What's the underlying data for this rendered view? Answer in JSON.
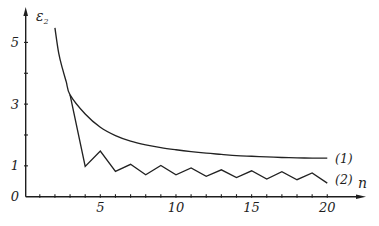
{
  "chart_data": {
    "type": "line",
    "title": "",
    "xlabel": "n",
    "ylabel": "ε",
    "ylabel_subscript": "2",
    "xlim": [
      0,
      22.5
    ],
    "ylim": [
      0,
      6.1
    ],
    "grid": false,
    "legend": "inline labels at right end of each curve",
    "x_ticks": [
      1,
      2,
      3,
      4,
      5,
      6,
      7,
      8,
      9,
      10,
      11,
      12,
      13,
      14,
      15,
      16,
      17,
      18,
      19,
      20
    ],
    "x_tick_labels": [
      {
        "value": 5,
        "label": "5"
      },
      {
        "value": 10,
        "label": "10"
      },
      {
        "value": 15,
        "label": "15"
      },
      {
        "value": 20,
        "label": "20"
      }
    ],
    "y_ticks": [
      1,
      2,
      3,
      4,
      5
    ],
    "y_tick_labels": [
      {
        "value": 0,
        "label": "0"
      },
      {
        "value": 1,
        "label": "1"
      },
      {
        "value": 3,
        "label": "3"
      },
      {
        "value": 5,
        "label": "5"
      }
    ],
    "series": [
      {
        "name": "(1)",
        "smooth": true,
        "x": [
          2,
          2.25,
          2.5,
          2.75,
          3,
          4,
          5,
          6,
          7,
          8,
          9,
          10,
          11,
          12,
          13,
          14,
          15,
          16,
          17,
          18,
          19,
          20
        ],
        "values": [
          5.47,
          4.65,
          4.15,
          3.72,
          3.3,
          2.68,
          2.25,
          1.98,
          1.8,
          1.68,
          1.59,
          1.52,
          1.46,
          1.41,
          1.37,
          1.33,
          1.31,
          1.29,
          1.27,
          1.26,
          1.25,
          1.25
        ]
      },
      {
        "name": "(2)",
        "smooth": false,
        "x": [
          3,
          4,
          5,
          6,
          7,
          8,
          9,
          10,
          11,
          12,
          13,
          14,
          15,
          16,
          17,
          18,
          19,
          20
        ],
        "values": [
          3.3,
          0.98,
          1.48,
          0.82,
          1.05,
          0.71,
          1.01,
          0.71,
          0.93,
          0.66,
          0.87,
          0.62,
          0.84,
          0.57,
          0.81,
          0.55,
          0.77,
          0.44
        ]
      }
    ]
  },
  "colors": {
    "line": "#222222",
    "background": "#ffffff"
  }
}
